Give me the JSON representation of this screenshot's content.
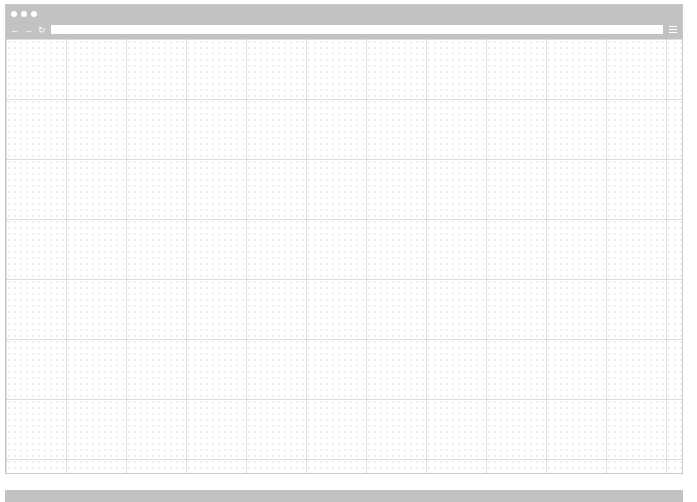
{
  "browser": {
    "window_controls": [
      "close",
      "minimize",
      "maximize"
    ],
    "nav": {
      "back_icon": "←",
      "forward_icon": "→",
      "reload_icon": "↻"
    },
    "address_bar": {
      "value": "",
      "placeholder": ""
    },
    "menu_icon": "hamburger-menu"
  },
  "page": {
    "content": "empty grid placeholder"
  },
  "colors": {
    "frame": "#c2c2c2",
    "background": "#ffffff",
    "grid": "#d0d0d0"
  }
}
